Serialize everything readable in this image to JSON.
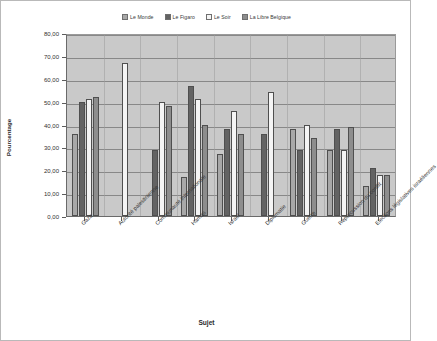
{
  "chart_data": {
    "type": "bar",
    "title": "",
    "xlabel": "Sujet",
    "ylabel": "Pourcentage",
    "ylim": [
      0,
      80
    ],
    "ytick_step": 10,
    "ytick_labels": [
      "0,00",
      "10,00",
      "20,00",
      "30,00",
      "40,00",
      "50,00",
      "60,00",
      "70,00",
      "80,00"
    ],
    "grid": true,
    "legend_position": "top-center",
    "categories": [
      "Gaza",
      "Autorité palestinienne",
      "Communauté internationale",
      "Hamas",
      "Israël",
      "Diplomatie",
      "Guerre",
      "Répercussion du conflit",
      "Elections législatives israéliennes"
    ],
    "series": [
      {
        "name": "Le Monde",
        "color": "#a8a8a8",
        "values": [
          36,
          0,
          0,
          17,
          27,
          0,
          38,
          29,
          13
        ]
      },
      {
        "name": "Le Figaro",
        "color": "#636363",
        "values": [
          50,
          0,
          29,
          57,
          38,
          36,
          29,
          38,
          21
        ]
      },
      {
        "name": "Le Soir",
        "color": "#f4f4f4",
        "values": [
          51,
          67,
          50,
          51,
          46,
          54,
          40,
          29,
          18
        ]
      },
      {
        "name": "La Libre Belgique",
        "color": "#8d8d8d",
        "values": [
          52,
          0,
          48,
          40,
          36,
          0,
          34,
          39,
          18
        ]
      }
    ]
  },
  "legend": {
    "items": [
      {
        "label": "Le Monde",
        "color": "#a8a8a8"
      },
      {
        "label": "Le Figaro",
        "color": "#636363"
      },
      {
        "label": "Le Soir",
        "color": "#f4f4f4"
      },
      {
        "label": "La Libre Belgique",
        "color": "#8d8d8d"
      }
    ]
  },
  "axes": {
    "y_title": "Pourcentage",
    "x_title": "Sujet"
  }
}
